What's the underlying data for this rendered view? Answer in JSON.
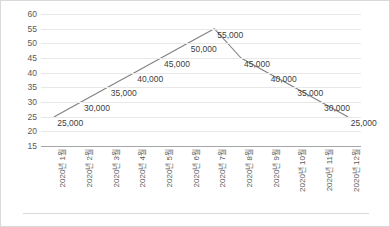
{
  "chart_data": {
    "type": "line",
    "title": "",
    "subtitle": "",
    "xlabel": "",
    "ylabel": "",
    "categories": [
      "2020년 1월",
      "2020년 2월",
      "2020년 3월",
      "2020년 4월",
      "2020년 5월",
      "2020년 6월",
      "2020년 7월",
      "2020년 8월",
      "2020년 9월",
      "2020년 10월",
      "2020년 11월",
      "2020년 12월"
    ],
    "values": [
      25000,
      30000,
      35000,
      40000,
      45000,
      50000,
      55000,
      45000,
      40000,
      35000,
      30000,
      25000
    ],
    "data_labels": [
      "25,000",
      "30,000",
      "35,000",
      "40,000",
      "45,000",
      "50,000",
      "55,000",
      "45,000",
      "40,000",
      "35,000",
      "30,000",
      "25,000"
    ],
    "ylim": [
      15,
      60
    ],
    "ytick_values": [
      60,
      55,
      50,
      45,
      40,
      35,
      30,
      25,
      20,
      15
    ],
    "ytick_labels": [
      "60",
      "55",
      "50",
      "45",
      "40",
      "35",
      "30",
      "25",
      "20",
      "15"
    ],
    "value_scale_divisor": 1000,
    "grid": true,
    "legend": false,
    "legend_position": "none",
    "series": [
      {
        "name": "",
        "values": [
          25000,
          30000,
          35000,
          40000,
          45000,
          50000,
          55000,
          45000,
          40000,
          35000,
          30000,
          25000
        ]
      }
    ],
    "colors": {
      "line": "#808080",
      "gridline": "#e8e8e8",
      "axis": "#a6a6a6",
      "tick_text": "#595959",
      "label_text": "#404040",
      "border": "#d9d9d9",
      "background": "#ffffff"
    }
  }
}
